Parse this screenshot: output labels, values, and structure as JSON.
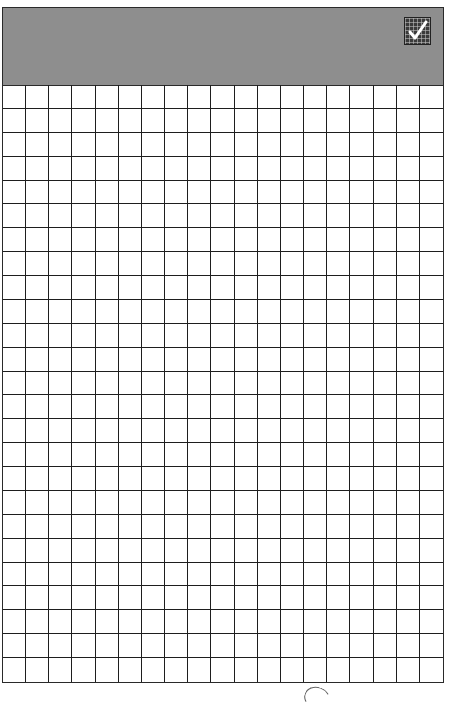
{
  "pad": {
    "header": {
      "title": "",
      "background_color": "#8e8e8e",
      "icon": "checkmark-grid-icon"
    },
    "grid": {
      "columns": 19,
      "rows": 25,
      "line_color": "#1e1e1e",
      "background_color": "#ffffff"
    }
  },
  "footer": {
    "mark": "curved-scribble"
  }
}
